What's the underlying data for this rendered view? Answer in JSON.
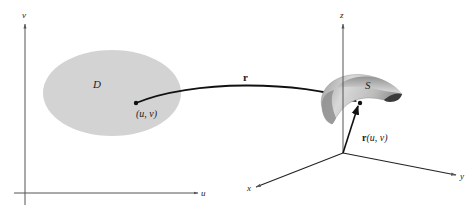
{
  "diagram": {
    "type": "parametric-surface-mapping",
    "left_plane": {
      "axis_horizontal_label": "u",
      "axis_vertical_label": "v",
      "region_label": "D",
      "point_label": "(u, v)",
      "region_color": "#d3d3d3"
    },
    "mapping": {
      "label": "r"
    },
    "right_space": {
      "axis_x_label": "x",
      "axis_y_label": "y",
      "axis_z_label": "z",
      "surface_label": "S",
      "vector_label_bold": "r",
      "vector_label_args": "(u, v)",
      "surface_light_color": "#e6e6e6",
      "surface_mid_color": "#a8a8a8",
      "surface_dark_color": "#3a3a3a"
    },
    "colors": {
      "axis": "#555555",
      "arrow": "#111111"
    }
  }
}
